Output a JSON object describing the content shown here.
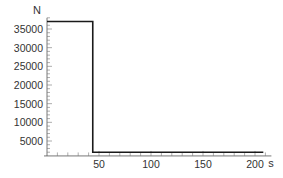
{
  "chart_data": {
    "type": "line",
    "title": "",
    "xlabel": "s",
    "ylabel": "N",
    "xlim": [
      0,
      210
    ],
    "ylim": [
      1000,
      38000
    ],
    "x_axis_crossing_y": 1000,
    "x_ticks": [
      50,
      100,
      150,
      200
    ],
    "x_tick_labels": [
      "50",
      "100",
      "150",
      "200"
    ],
    "x_minor_tick_step": 10,
    "y_ticks": [
      5000,
      10000,
      15000,
      20000,
      25000,
      30000,
      35000
    ],
    "y_tick_labels": [
      "5000",
      "10000",
      "15000",
      "20000",
      "25000",
      "30000",
      "35000"
    ],
    "y_minor_tick_step": 1000,
    "grid": false,
    "legend": null,
    "series": [
      {
        "name": "force",
        "color": "#1a1a1a",
        "x": [
          0,
          44,
          44,
          208
        ],
        "y": [
          37000,
          37000,
          2000,
          2000
        ]
      }
    ]
  }
}
